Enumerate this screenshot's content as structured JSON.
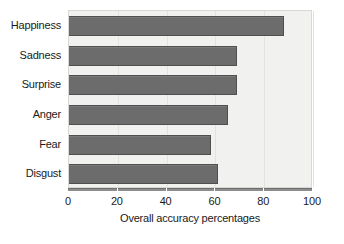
{
  "chart_data": {
    "type": "bar",
    "orientation": "horizontal",
    "title": "",
    "subtitle": "",
    "categories": [
      "Happiness",
      "Sadness",
      "Surprise",
      "Anger",
      "Fear",
      "Disgust"
    ],
    "values": [
      88,
      69,
      69,
      65,
      58,
      61
    ],
    "series": [
      {
        "name": "Overall accuracy percentages",
        "values": [
          88,
          69,
          69,
          65,
          58,
          61
        ]
      }
    ],
    "xlabel": "Overall accuracy percentages",
    "ylabel": "",
    "xlim": [
      0,
      100
    ],
    "xticks": [
      0,
      20,
      40,
      60,
      80,
      100
    ],
    "xtick_labels": [
      "0",
      "20",
      "40",
      "60",
      "80",
      "100"
    ],
    "grid": "vertical-faint",
    "legend": "none",
    "bar_color": "#6c6c6c",
    "bar_edge_color": "#4f4f4f",
    "plot_background": "#f1f1ef",
    "figure_background": "#ffffff",
    "axis_color": "#8d8d8d",
    "text_color": "#1a1a1a"
  }
}
